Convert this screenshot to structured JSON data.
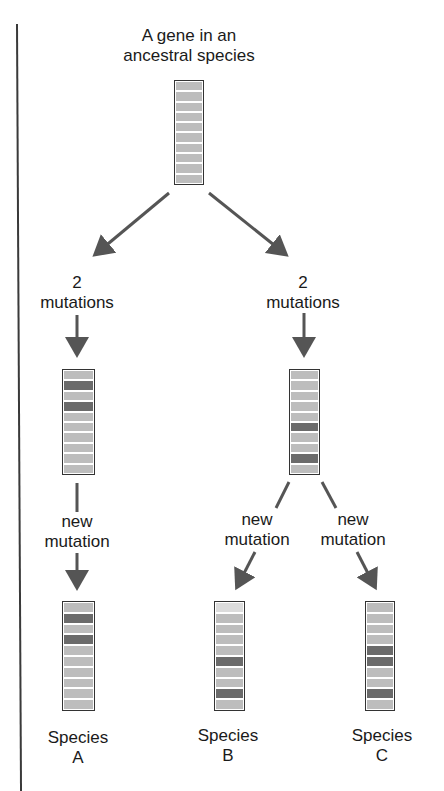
{
  "diagram": {
    "title": "A gene in an ancestral species",
    "title_lines": [
      "A gene in an",
      "ancestral species"
    ],
    "colors": {
      "band_normal": "#bdbdbd",
      "band_mutated": "#6b6b6b",
      "band_light": "#dcdcdc",
      "arrow": "#555555",
      "border": "#333333"
    },
    "nodes": [
      {
        "id": "ancestor",
        "label": "",
        "bands": [
          "n",
          "n",
          "n",
          "n",
          "n",
          "n",
          "n",
          "n",
          "n",
          "n"
        ]
      },
      {
        "id": "intermediate-left",
        "label": "",
        "bands": [
          "n",
          "d",
          "n",
          "d",
          "n",
          "n",
          "n",
          "n",
          "n",
          "n"
        ]
      },
      {
        "id": "intermediate-right",
        "label": "",
        "bands": [
          "n",
          "n",
          "n",
          "n",
          "n",
          "d",
          "n",
          "n",
          "d",
          "n"
        ]
      },
      {
        "id": "species-a",
        "label": "Species A",
        "bands": [
          "n",
          "d",
          "n",
          "d",
          "n",
          "n",
          "n",
          "n",
          "n",
          "n"
        ]
      },
      {
        "id": "species-b",
        "label": "Species B",
        "bands": [
          "l",
          "n",
          "n",
          "n",
          "n",
          "d",
          "n",
          "n",
          "d",
          "n"
        ]
      },
      {
        "id": "species-c",
        "label": "Species C",
        "bands": [
          "n",
          "n",
          "n",
          "n",
          "d",
          "d",
          "n",
          "n",
          "d",
          "n"
        ]
      }
    ],
    "edges": [
      {
        "from": "ancestor",
        "to": "intermediate-left",
        "label": "2 mutations"
      },
      {
        "from": "ancestor",
        "to": "intermediate-right",
        "label": "2 mutations"
      },
      {
        "from": "intermediate-left",
        "to": "species-a",
        "label": "new mutation"
      },
      {
        "from": "intermediate-right",
        "to": "species-b",
        "label": "new mutation"
      },
      {
        "from": "intermediate-right",
        "to": "species-c",
        "label": "new mutation"
      }
    ],
    "labels": {
      "title_line1": "A gene in an",
      "title_line2": "ancestral species",
      "mut_left_1": "2",
      "mut_left_2": "mutations",
      "mut_right_1": "2",
      "mut_right_2": "mutations",
      "new_a_1": "new",
      "new_a_2": "mutation",
      "new_b_1": "new",
      "new_b_2": "mutation",
      "new_c_1": "new",
      "new_c_2": "mutation",
      "species_a_1": "Species",
      "species_a_2": "A",
      "species_b_1": "Species",
      "species_b_2": "B",
      "species_c_1": "Species",
      "species_c_2": "C"
    }
  }
}
